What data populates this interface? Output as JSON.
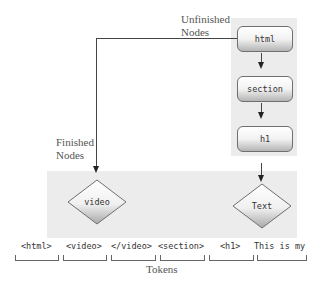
{
  "labels": {
    "unfinished_nodes": [
      "Unfinished",
      "Nodes"
    ],
    "finished_nodes": [
      "Finished",
      "Nodes"
    ],
    "tokens": "Tokens"
  },
  "stack_nodes": [
    {
      "label": "html"
    },
    {
      "label": "section"
    },
    {
      "label": "h1"
    }
  ],
  "finished_nodes": [
    {
      "label": "video"
    },
    {
      "label": "Text"
    }
  ],
  "tokens": [
    {
      "label": "<html>"
    },
    {
      "label": "<video>"
    },
    {
      "label": "</video>"
    },
    {
      "label": "<section>"
    },
    {
      "label": "<h1>"
    },
    {
      "label": "This is my"
    }
  ],
  "colors": {
    "panel_bg": "#ececec",
    "line": "#444444",
    "text_label": "#555555"
  }
}
